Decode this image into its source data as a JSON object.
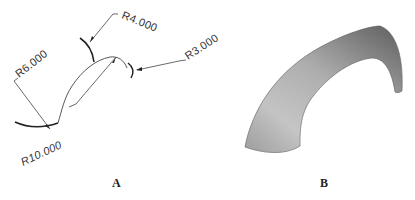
{
  "figure": {
    "panel_a": {
      "label": "A",
      "description": "2D profile sketch with radius dimensions",
      "dimensions": [
        {
          "id": "r6",
          "text": "R6.000"
        },
        {
          "id": "r4",
          "text": "R4.000"
        },
        {
          "id": "r3",
          "text": "R3.000"
        },
        {
          "id": "r10",
          "text": "R10.000"
        }
      ]
    },
    "panel_b": {
      "label": "B",
      "description": "Shaded 3D swept surface (arch)"
    }
  },
  "colors": {
    "line": "#333333",
    "thick_line": "#222222",
    "surface_light": "#d9d9d9",
    "surface_mid": "#a8a8a8",
    "surface_dark": "#6f6f6f"
  }
}
